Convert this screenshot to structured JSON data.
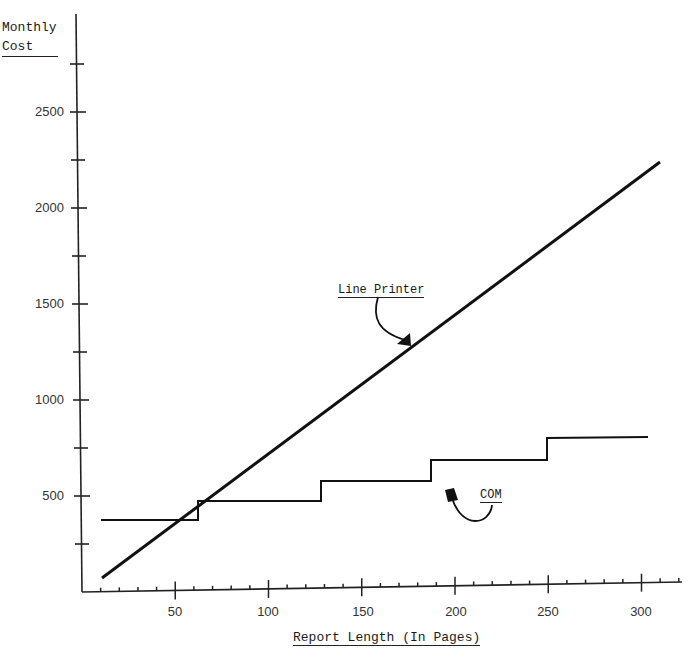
{
  "chart_data": {
    "type": "line",
    "title": "",
    "xlabel": "Report Length (In Pages)",
    "ylabel": "Monthly Cost",
    "xlim": [
      0,
      320
    ],
    "ylim": [
      0,
      2800
    ],
    "x_ticks": [
      50,
      100,
      150,
      200,
      250,
      300
    ],
    "y_ticks": [
      500,
      1000,
      1500,
      2000,
      2500
    ],
    "grid": false,
    "legend": "none (inline annotations)",
    "series": [
      {
        "name": "Line Printer",
        "style": "straight line",
        "points": [
          [
            10,
            75
          ],
          [
            310,
            2240
          ]
        ]
      },
      {
        "name": "COM",
        "style": "step",
        "points": [
          [
            10,
            375
          ],
          [
            62,
            375
          ],
          [
            62,
            475
          ],
          [
            128,
            475
          ],
          [
            128,
            575
          ],
          [
            187,
            575
          ],
          [
            187,
            685
          ],
          [
            249,
            685
          ],
          [
            249,
            800
          ],
          [
            303,
            800
          ]
        ]
      }
    ],
    "annotations": [
      {
        "text": "Line Printer",
        "points_to": "Line Printer"
      },
      {
        "text": "COM",
        "points_to": "COM"
      }
    ]
  },
  "labels": {
    "ylabel_line1": "Monthly",
    "ylabel_line2": "Cost",
    "xlabel": "Report Length (In Pages)",
    "annot_lp": "Line Printer",
    "annot_com": "COM",
    "yticks": [
      "2500",
      "2000",
      "1500",
      "1000",
      "500"
    ],
    "xticks": [
      "50",
      "100",
      "150",
      "200",
      "250",
      "300"
    ]
  }
}
